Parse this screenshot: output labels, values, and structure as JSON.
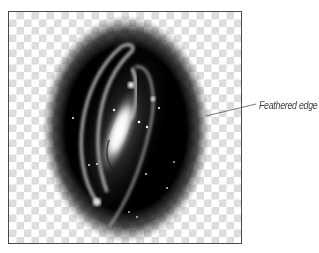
{
  "figure": {
    "callout_label": "Feathered edge",
    "image_subject": "spiral galaxy in feathered oval selection",
    "icon": "feathered-oval-image",
    "colors": {
      "frame_border": "#4a4a4a",
      "checker_light": "#ffffff",
      "checker_dark": "#dcdcdc",
      "oval_fill": "#000000",
      "label_text": "#3e3e3e",
      "leader_line": "#555555"
    }
  }
}
